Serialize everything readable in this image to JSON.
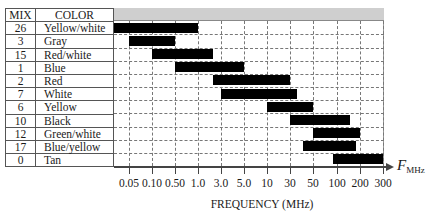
{
  "table": {
    "headers": {
      "mix": "MIX",
      "color": "COLOR"
    },
    "rows": [
      {
        "mix": "26",
        "color": "Yellow/white"
      },
      {
        "mix": "3",
        "color": "Gray"
      },
      {
        "mix": "15",
        "color": "Red/white"
      },
      {
        "mix": "1",
        "color": "Blue"
      },
      {
        "mix": "2",
        "color": "Red"
      },
      {
        "mix": "7",
        "color": "White"
      },
      {
        "mix": "6",
        "color": "Yellow"
      },
      {
        "mix": "10",
        "color": "Black"
      },
      {
        "mix": "12",
        "color": "Green/white"
      },
      {
        "mix": "17",
        "color": "Blue/yellow"
      },
      {
        "mix": "0",
        "color": "Tan"
      }
    ]
  },
  "axis": {
    "xlabel": "FREQUENCY (MHz)",
    "arrow_label_main": "F",
    "arrow_label_sub": "MHz",
    "ticks": [
      "0.05",
      "0.10",
      "0.50",
      "1.0",
      "3.0",
      "5.0",
      "10",
      "30",
      "50",
      "100",
      "200",
      "300"
    ]
  },
  "colors": {
    "bar": "#000000",
    "header_band": "#cfcfcf",
    "grid": "#777777"
  },
  "chart_data": {
    "type": "bar",
    "subtype": "horizontal-range (gantt-style) on categorical-log frequency axis",
    "title": "",
    "xlabel": "FREQUENCY (MHz)",
    "ylabel": "",
    "x_ticks": [
      "0.05",
      "0.10",
      "0.50",
      "1.0",
      "3.0",
      "5.0",
      "10",
      "30",
      "50",
      "100",
      "200",
      "300"
    ],
    "x_unit": "MHz",
    "grid": true,
    "legend": null,
    "categories": [
      "26 Yellow/white",
      "3 Gray",
      "15 Red/white",
      "1 Blue",
      "2 Red",
      "7 White",
      "6 Yellow",
      "10 Black",
      "12 Green/white",
      "17 Blue/yellow",
      "0 Tan"
    ],
    "series": [
      {
        "name": "Yellow/white (26)",
        "mix": "26",
        "start_mhz": 0.02,
        "end_mhz": 1.0
      },
      {
        "name": "Gray (3)",
        "mix": "3",
        "start_mhz": 0.05,
        "end_mhz": 0.5
      },
      {
        "name": "Red/white (15)",
        "mix": "15",
        "start_mhz": 0.1,
        "end_mhz": 2.0
      },
      {
        "name": "Blue (1)",
        "mix": "1",
        "start_mhz": 0.5,
        "end_mhz": 5.0
      },
      {
        "name": "Red (2)",
        "mix": "2",
        "start_mhz": 2.0,
        "end_mhz": 30
      },
      {
        "name": "White (7)",
        "mix": "7",
        "start_mhz": 3.0,
        "end_mhz": 35
      },
      {
        "name": "Yellow (6)",
        "mix": "6",
        "start_mhz": 10,
        "end_mhz": 50
      },
      {
        "name": "Black (10)",
        "mix": "10",
        "start_mhz": 30,
        "end_mhz": 150
      },
      {
        "name": "Green/white (12)",
        "mix": "12",
        "start_mhz": 50,
        "end_mhz": 200
      },
      {
        "name": "Blue/yellow (17)",
        "mix": "17",
        "start_mhz": 40,
        "end_mhz": 180
      },
      {
        "name": "Tan (0)",
        "mix": "0",
        "start_mhz": 90,
        "end_mhz": 300
      }
    ]
  }
}
